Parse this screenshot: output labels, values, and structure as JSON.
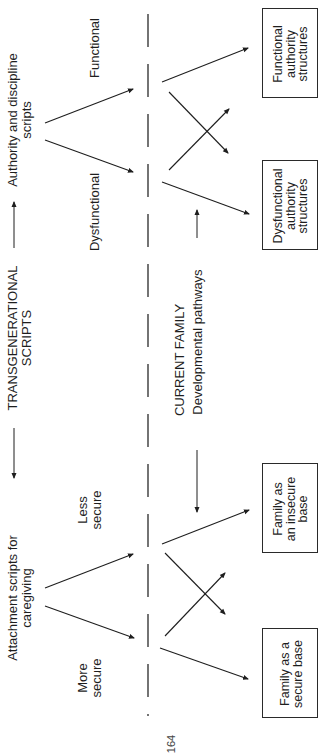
{
  "diagram": {
    "header_row": {
      "left_label": "Attachment scripts for\ncaregiving",
      "center_label": "TRANSGENERATIONAL\nSCRIPTS",
      "right_label": "Authority and discipline\nscripts"
    },
    "attachment_branches": {
      "upper": "Less\nsecure",
      "lower": "More\nsecure"
    },
    "authority_branches": {
      "upper": "Functional",
      "lower": "Dysfunctional"
    },
    "middle_row": {
      "title": "CURRENT FAMILY",
      "subtitle": "Developmental pathways"
    },
    "outcome_boxes": [
      {
        "id": "functional",
        "label": "Functional\nauthority\nstructures"
      },
      {
        "id": "dysfunctional",
        "label": "Dysfunctional\nauthority\nstructures"
      },
      {
        "id": "insecure",
        "label": "Family as\nan insecure\nbase"
      },
      {
        "id": "secure",
        "label": "Family as a\nsecure base"
      }
    ],
    "page_number": "164",
    "colors": {
      "ink": "#1e1e1e",
      "dashed_line": "#2a2a2a",
      "background": "#ffffff"
    }
  }
}
